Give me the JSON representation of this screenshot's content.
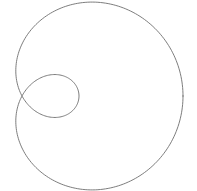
{
  "figure": {
    "title": "",
    "background_color": "#ffffff",
    "width": 197,
    "height": 191
  },
  "curve": {
    "name": "limacon-with-inner-loop",
    "stroke_color": "#6e6e6e",
    "stroke_width": 0.9,
    "fill": "none"
  },
  "chart_data": {
    "type": "line",
    "title": "",
    "subtitle": "",
    "xlabel": "",
    "ylabel": "",
    "legend": [],
    "legend_position": "none",
    "grid": false,
    "axes_visible": false,
    "tick_labels_x": [],
    "tick_labels_y": [],
    "curve_equation": "r = b + a*cos(theta)",
    "parameters": {
      "a": 109,
      "b": 52
    },
    "pole_px": {
      "x": 22,
      "y": 96
    },
    "theta_range_deg": [
      0,
      360
    ],
    "theta_step_deg": 1,
    "xlim": [
      0,
      197
    ],
    "ylim": [
      0,
      191
    ],
    "pixel_extents": {
      "outer_top_y": 12,
      "outer_bottom_y": 177,
      "outer_left_x": 12,
      "outer_right_x": 183,
      "inner_loop_right_x": 79,
      "inner_loop_top_y": 77,
      "inner_loop_bottom_y": 116,
      "node_x": 22,
      "node_y": 96
    },
    "series": [
      {
        "name": "limacon",
        "color": "#6e6e6e",
        "closed": true,
        "points_polar_deg_r": [
          [
            0,
            161
          ],
          [
            10,
            159.3
          ],
          [
            20,
            154.4
          ],
          [
            30,
            146.4
          ],
          [
            40,
            135.5
          ],
          [
            50,
            122.1
          ],
          [
            60,
            106.5
          ],
          [
            70,
            89.3
          ],
          [
            80,
            70.9
          ],
          [
            90,
            52.0
          ],
          [
            100,
            33.1
          ],
          [
            110,
            14.7
          ],
          [
            120,
            -2.5
          ],
          [
            130,
            -18.1
          ],
          [
            140,
            -31.5
          ],
          [
            150,
            -42.4
          ],
          [
            160,
            -50.4
          ],
          [
            170,
            -55.3
          ],
          [
            180,
            -57.0
          ],
          [
            190,
            -55.3
          ],
          [
            200,
            -50.4
          ],
          [
            210,
            -42.4
          ],
          [
            220,
            -31.5
          ],
          [
            230,
            -18.1
          ],
          [
            240,
            -2.5
          ],
          [
            250,
            14.7
          ],
          [
            260,
            33.1
          ],
          [
            270,
            52.0
          ],
          [
            280,
            70.9
          ],
          [
            290,
            89.3
          ],
          [
            300,
            106.5
          ],
          [
            310,
            122.1
          ],
          [
            320,
            135.5
          ],
          [
            330,
            146.4
          ],
          [
            340,
            154.4
          ],
          [
            350,
            159.3
          ],
          [
            360,
            161
          ]
        ]
      }
    ]
  }
}
